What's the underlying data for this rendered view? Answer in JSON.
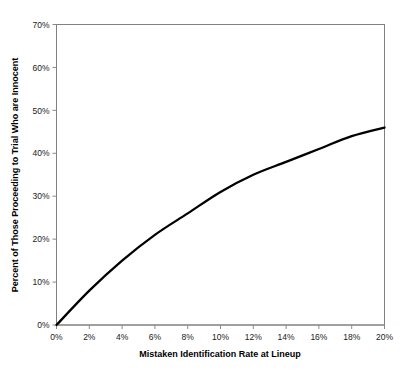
{
  "chart_data": {
    "type": "line",
    "title": "",
    "subtitle": "",
    "xlabel": "Mistaken Identification Rate at Lineup",
    "ylabel": "Percent of Those Proceeding to Trial Who are Innocent",
    "xlim": [
      0,
      20
    ],
    "ylim": [
      0,
      70
    ],
    "xtick_labels": [
      "0%",
      "2%",
      "4%",
      "6%",
      "8%",
      "10%",
      "12%",
      "14%",
      "16%",
      "18%",
      "20%"
    ],
    "xtick_values": [
      0,
      2,
      4,
      6,
      8,
      10,
      12,
      14,
      16,
      18,
      20
    ],
    "ytick_labels": [
      "0%",
      "10%",
      "20%",
      "30%",
      "40%",
      "50%",
      "60%",
      "70%"
    ],
    "ytick_values": [
      0,
      10,
      20,
      30,
      40,
      50,
      60,
      70
    ],
    "grid": false,
    "legend": false,
    "legend_position": "none",
    "line_color": "#000000",
    "axis_color": "#808080",
    "background_color": "#ffffff",
    "series": [
      {
        "name": "Percent Innocent Among Those Proceeding to Trial",
        "x": [
          0,
          0.5,
          1,
          1.5,
          2,
          2.5,
          3,
          3.5,
          4,
          4.5,
          5,
          5.5,
          6,
          6.5,
          7,
          7.5,
          8,
          8.5,
          9,
          9.5,
          10,
          10.5,
          11,
          11.5,
          12,
          12.5,
          13,
          13.5,
          14,
          14.5,
          15,
          15.5,
          16,
          16.5,
          17,
          17.5,
          18,
          18.5,
          19,
          19.5,
          20
        ],
        "values": [
          0,
          2.3,
          4.5,
          6.4,
          8.3,
          10.0,
          11.7,
          13.2,
          14.7,
          16.1,
          17.5,
          18.8,
          20.1,
          21.3,
          22.5,
          23.6,
          24.7,
          25.8,
          26.8,
          27.8,
          28.8,
          29.7,
          30.6,
          31.5,
          32.4,
          33.3,
          34.1,
          34.9,
          35.7,
          36.5,
          37.2,
          38.0,
          38.7,
          39.4,
          40.1,
          40.7,
          41.4,
          42.0,
          42.6,
          43.2,
          43.8
        ]
      }
    ],
    "key_points": [
      {
        "x": 0,
        "y": 0
      },
      {
        "x": 2,
        "y": 8
      },
      {
        "x": 4,
        "y": 15
      },
      {
        "x": 6,
        "y": 21
      },
      {
        "x": 8,
        "y": 26
      },
      {
        "x": 10,
        "y": 31
      },
      {
        "x": 12,
        "y": 35
      },
      {
        "x": 14,
        "y": 38
      },
      {
        "x": 16,
        "y": 41
      },
      {
        "x": 18,
        "y": 44
      },
      {
        "x": 20,
        "y": 46
      }
    ]
  }
}
